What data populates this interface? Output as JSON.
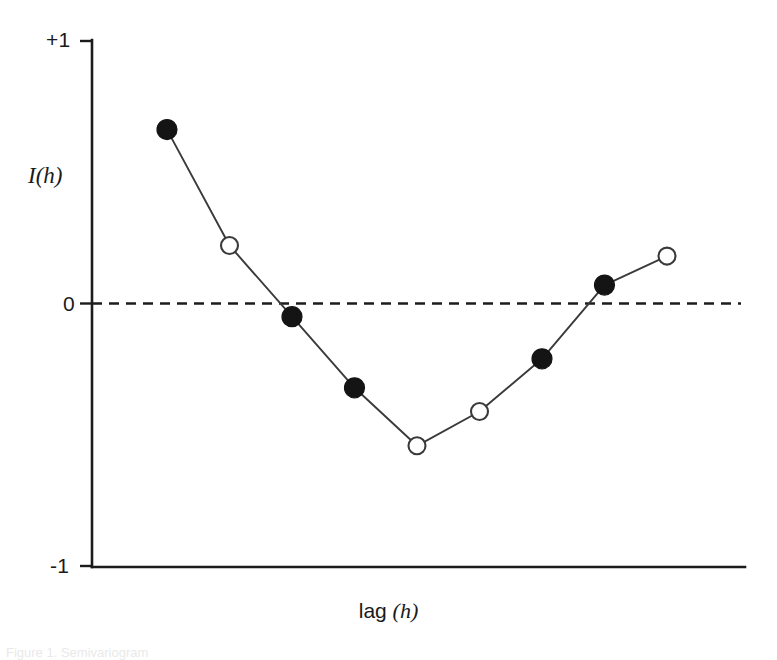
{
  "figure": {
    "background_color": "#ffffff",
    "line_color": "#3a3a3a",
    "axis_color": "#1c1c1c",
    "caption": "Figure 1. Semivariogram",
    "width": 777,
    "height": 656
  },
  "axes": {
    "y_title": "I(h)",
    "x_title_main": "lag",
    "x_title_var": "(h)",
    "y_tick_top": "+1",
    "y_tick_zero": "0",
    "y_tick_bottom": "-1"
  },
  "chart_data": {
    "type": "line",
    "title": "",
    "subtitle": "",
    "xlabel": "lag (h)",
    "ylabel": "I(h)",
    "ylim": [
      -1,
      1
    ],
    "yticks": [
      -1,
      0,
      1
    ],
    "ytick_labels": [
      "-1",
      "0",
      "+1"
    ],
    "xlim": [
      0,
      10
    ],
    "xticks": [],
    "xtick_labels": [],
    "grid": false,
    "legend": null,
    "reference_lines": [
      {
        "axis": "y",
        "value": 0,
        "style": "dashed",
        "color": "#1c1c1c"
      }
    ],
    "series": [
      {
        "name": "Moran's I by lag",
        "x": [
          1,
          2,
          3,
          4,
          5,
          6,
          7,
          8,
          9
        ],
        "values": [
          0.66,
          0.22,
          -0.05,
          -0.32,
          -0.54,
          -0.41,
          -0.21,
          0.07,
          0.18
        ],
        "marker_fill": [
          "filled",
          "open",
          "filled",
          "filled",
          "open",
          "open",
          "filled",
          "filled",
          "open"
        ],
        "marker_note": "filled = statistically significant; open = not significant"
      }
    ]
  }
}
